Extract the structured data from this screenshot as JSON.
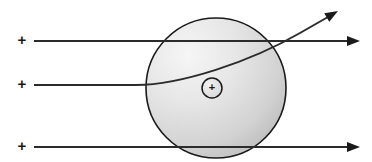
{
  "figure": {
    "background_color": "#ffffff",
    "width": 372,
    "height": 162
  },
  "sphere": {
    "name": "positively-charged-sphere",
    "center_x": 216,
    "center_y": 88,
    "radius": 70,
    "outline_color": "#1a1a1a",
    "outline_width": 1.6,
    "fill_light": "#f2f2f2",
    "fill_mid": "#dcdcdc",
    "fill_dark": "#b8b8b8",
    "highlight_x": 186,
    "highlight_y": 52
  },
  "nucleus": {
    "name": "nucleus-marker",
    "center_x": 212,
    "center_y": 88,
    "radius": 10,
    "charge_symbol": "+",
    "outline_color": "#1a1a1a",
    "fill_color": "#dedede"
  },
  "charge_labels": [
    {
      "symbol": "+",
      "x": 22,
      "y": 41
    },
    {
      "symbol": "+",
      "x": 22,
      "y": 85
    },
    {
      "symbol": "+",
      "x": 22,
      "y": 147
    }
  ],
  "trajectories": [
    {
      "name": "alpha-particle-path-top",
      "type": "undeflected",
      "stroke": "#2b2b2b",
      "stroke_width": 2.0,
      "path": "M 34 41 L 348 41",
      "arrow_tip_x": 360,
      "arrow_tip_y": 41,
      "arrow_angle_deg": 0
    },
    {
      "name": "alpha-particle-path-deflected",
      "type": "deflected",
      "stroke": "#2b2b2b",
      "stroke_width": 2.0,
      "path": "M 34 85 L 136 85 C 180 85 250 62 300 33 L 328 17",
      "arrow_tip_x": 338,
      "arrow_tip_y": 11,
      "arrow_angle_deg": -30
    },
    {
      "name": "alpha-particle-path-bottom",
      "type": "undeflected",
      "stroke": "#2b2b2b",
      "stroke_width": 2.0,
      "path": "M 34 147 L 348 147",
      "arrow_tip_x": 360,
      "arrow_tip_y": 147,
      "arrow_angle_deg": 0
    }
  ],
  "arrowhead": {
    "name": "arrowhead",
    "length": 13,
    "half_width": 5,
    "color": "#1a1a1a"
  }
}
